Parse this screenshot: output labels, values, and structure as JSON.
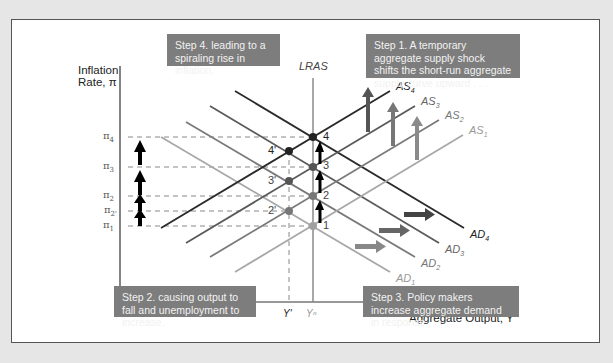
{
  "figure": {
    "y_axis_label_line1": "Inflation",
    "y_axis_label_line2": "Rate, π",
    "x_axis_label": "Aggregate Output, Y",
    "lras_label": "LRAS",
    "x_ticks": {
      "y_prime": "Y'",
      "y_natural": "Yⁿ"
    },
    "pi_ticks": [
      {
        "base": "π",
        "sub": "4"
      },
      {
        "base": "π",
        "sub": "3"
      },
      {
        "base": "π",
        "sub": "2"
      },
      {
        "base": "π",
        "sub": "2'"
      },
      {
        "base": "π",
        "sub": "1"
      }
    ],
    "curves": {
      "as": [
        {
          "base": "AS",
          "sub": "4"
        },
        {
          "base": "AS",
          "sub": "3"
        },
        {
          "base": "AS",
          "sub": "2"
        },
        {
          "base": "AS",
          "sub": "1"
        }
      ],
      "ad": [
        {
          "base": "AD",
          "sub": "4"
        },
        {
          "base": "AD",
          "sub": "3"
        },
        {
          "base": "AD",
          "sub": "2"
        },
        {
          "base": "AD",
          "sub": "1"
        }
      ]
    },
    "points": [
      "1",
      "2",
      "3",
      "4",
      "2'",
      "3'",
      "4'"
    ],
    "steps": {
      "step1": "Step 1. A temporary aggregate supply shock shifts the short-run aggregate supply curve upward . . .",
      "step2": "Step 2. causing output to fall and unemployment to increase.",
      "step3": "Step 3. Policy makers increase aggregate demand in response . . .",
      "step4": "Step 4. leading to a spiraling rise in inflation."
    },
    "colors": {
      "box_bg": "#7d7d7d",
      "curve_dark": "#333333",
      "curve_mid": "#6a6a6a",
      "curve_light": "#9a9a9a",
      "arrow": "#000000"
    }
  }
}
